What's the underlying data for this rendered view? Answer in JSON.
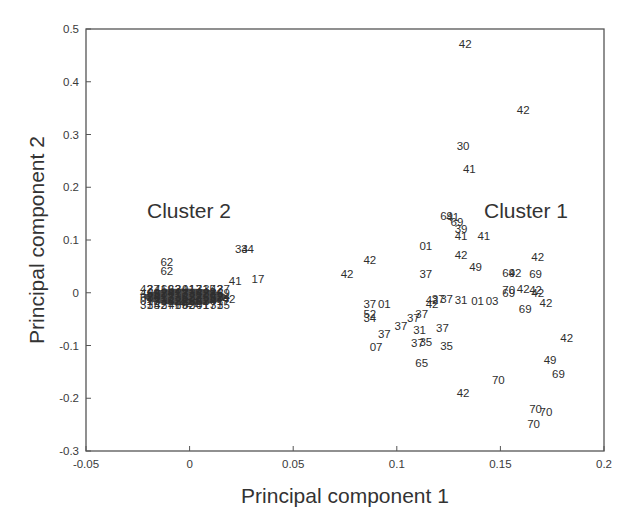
{
  "chart_data": {
    "type": "scatter",
    "title": "",
    "xlabel": "Principal component 1",
    "ylabel": "Principal component 2",
    "xlim": [
      -0.05,
      0.2
    ],
    "ylim": [
      -0.3,
      0.5
    ],
    "xticks": [
      -0.05,
      0,
      0.05,
      0.1,
      0.15,
      0.2
    ],
    "xtick_labels": [
      "-0.05",
      "0",
      "0.05",
      "0.1",
      "0.15",
      "0.2"
    ],
    "yticks": [
      -0.3,
      -0.2,
      -0.1,
      0,
      0.1,
      0.2,
      0.3,
      0.4,
      0.5
    ],
    "ytick_labels": [
      "-0.3",
      "-0.2",
      "-0.1",
      "0",
      "0.1",
      "0.2",
      "0.3",
      "0.4",
      "0.5"
    ],
    "grid": false,
    "legend": null,
    "annotations": [
      {
        "text": "Cluster 2",
        "x": -0.01,
        "y": 0.075
      },
      {
        "text": "Cluster 1",
        "x": 0.143,
        "y": 0.075
      }
    ],
    "marker": "text-label",
    "series": [
      {
        "name": "Cluster 1",
        "points": [
          {
            "label": "42",
            "x": 0.133,
            "y": 0.472
          },
          {
            "label": "42",
            "x": 0.161,
            "y": 0.347
          },
          {
            "label": "30",
            "x": 0.132,
            "y": 0.278
          },
          {
            "label": "41",
            "x": 0.135,
            "y": 0.235
          },
          {
            "label": "69",
            "x": 0.124,
            "y": 0.145
          },
          {
            "label": "41",
            "x": 0.127,
            "y": 0.143
          },
          {
            "label": "69",
            "x": 0.129,
            "y": 0.135
          },
          {
            "label": "39",
            "x": 0.131,
            "y": 0.12
          },
          {
            "label": "41",
            "x": 0.131,
            "y": 0.108
          },
          {
            "label": "41",
            "x": 0.142,
            "y": 0.108
          },
          {
            "label": "01",
            "x": 0.114,
            "y": 0.088
          },
          {
            "label": "42",
            "x": 0.087,
            "y": 0.063
          },
          {
            "label": "42",
            "x": 0.131,
            "y": 0.072
          },
          {
            "label": "42",
            "x": 0.168,
            "y": 0.068
          },
          {
            "label": "42",
            "x": 0.076,
            "y": 0.035
          },
          {
            "label": "37",
            "x": 0.114,
            "y": 0.035
          },
          {
            "label": "49",
            "x": 0.138,
            "y": 0.048
          },
          {
            "label": "69",
            "x": 0.154,
            "y": 0.038
          },
          {
            "label": "42",
            "x": 0.157,
            "y": 0.038
          },
          {
            "label": "69",
            "x": 0.167,
            "y": 0.035
          },
          {
            "label": "37",
            "x": 0.087,
            "y": -0.022
          },
          {
            "label": "01",
            "x": 0.094,
            "y": -0.022
          },
          {
            "label": "42",
            "x": 0.117,
            "y": -0.013
          },
          {
            "label": "37",
            "x": 0.12,
            "y": -0.011
          },
          {
            "label": "37",
            "x": 0.124,
            "y": -0.011
          },
          {
            "label": "42",
            "x": 0.117,
            "y": -0.022
          },
          {
            "label": "31",
            "x": 0.131,
            "y": -0.013
          },
          {
            "label": "01",
            "x": 0.139,
            "y": -0.015
          },
          {
            "label": "03",
            "x": 0.146,
            "y": -0.015
          },
          {
            "label": "70",
            "x": 0.154,
            "y": 0.005
          },
          {
            "label": "69",
            "x": 0.154,
            "y": -0.001
          },
          {
            "label": "42",
            "x": 0.161,
            "y": 0.008
          },
          {
            "label": "42",
            "x": 0.167,
            "y": 0.005
          },
          {
            "label": "42",
            "x": 0.168,
            "y": 0.0
          },
          {
            "label": "42",
            "x": 0.172,
            "y": -0.02
          },
          {
            "label": "69",
            "x": 0.162,
            "y": -0.03
          },
          {
            "label": "52",
            "x": 0.087,
            "y": -0.041
          },
          {
            "label": "34",
            "x": 0.087,
            "y": -0.047
          },
          {
            "label": "37",
            "x": 0.112,
            "y": -0.04
          },
          {
            "label": "37",
            "x": 0.108,
            "y": -0.048
          },
          {
            "label": "37",
            "x": 0.102,
            "y": -0.063
          },
          {
            "label": "37",
            "x": 0.094,
            "y": -0.078
          },
          {
            "label": "31",
            "x": 0.111,
            "y": -0.07
          },
          {
            "label": "37",
            "x": 0.122,
            "y": -0.066
          },
          {
            "label": "07",
            "x": 0.09,
            "y": -0.102
          },
          {
            "label": "37",
            "x": 0.11,
            "y": -0.095
          },
          {
            "label": "35",
            "x": 0.114,
            "y": -0.093
          },
          {
            "label": "35",
            "x": 0.124,
            "y": -0.1
          },
          {
            "label": "65",
            "x": 0.112,
            "y": -0.133
          },
          {
            "label": "42",
            "x": 0.182,
            "y": -0.085
          },
          {
            "label": "49",
            "x": 0.174,
            "y": -0.128
          },
          {
            "label": "69",
            "x": 0.178,
            "y": -0.154
          },
          {
            "label": "70",
            "x": 0.149,
            "y": -0.165
          },
          {
            "label": "42",
            "x": 0.132,
            "y": -0.19
          },
          {
            "label": "70",
            "x": 0.167,
            "y": -0.22
          },
          {
            "label": "70",
            "x": 0.172,
            "y": -0.226
          },
          {
            "label": "70",
            "x": 0.166,
            "y": -0.248
          }
        ]
      },
      {
        "name": "Cluster 2",
        "points": [
          {
            "label": "62",
            "x": -0.011,
            "y": 0.058
          },
          {
            "label": "62",
            "x": -0.011,
            "y": 0.042
          },
          {
            "label": "34",
            "x": 0.025,
            "y": 0.083
          },
          {
            "label": "34",
            "x": 0.028,
            "y": 0.083
          },
          {
            "label": "41",
            "x": 0.022,
            "y": 0.022
          },
          {
            "label": "17",
            "x": 0.033,
            "y": 0.027
          },
          {
            "label": "42",
            "x": 0.019,
            "y": -0.011
          },
          {
            "label": "42",
            "x": -0.002,
            "y": -0.02
          },
          {
            "label": "7",
            "x": 0.003,
            "y": -0.02
          },
          {
            "label": "dense overlapping labels",
            "x_range": [
              -0.022,
              0.018
            ],
            "y_range": [
              -0.018,
              0.01
            ]
          }
        ]
      }
    ]
  }
}
